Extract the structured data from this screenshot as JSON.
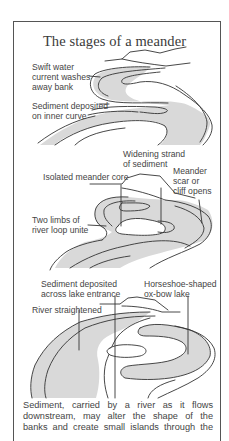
{
  "title": "The stages of a meander",
  "colors": {
    "river_fill": "#d9d9d9",
    "outline": "#333333",
    "frame": "#555555",
    "text": "#444444"
  },
  "panels": [
    {
      "stage": 1,
      "labels": [
        {
          "text": "Swift water\ncurrent washes\naway bank"
        },
        {
          "text": "Sediment deposited\non inner curve"
        }
      ]
    },
    {
      "stage": 2,
      "labels": [
        {
          "text": "Widening strand\nof sediment"
        },
        {
          "text": "Isolated meander core"
        },
        {
          "text": "Meander\nscar or\ncliff opens"
        },
        {
          "text": "Two limbs of\nriver loop unite"
        }
      ]
    },
    {
      "stage": 3,
      "labels": [
        {
          "text": "Sediment deposited\nacross lake entrance"
        },
        {
          "text": "Horseshoe-shaped\nox-bow lake"
        },
        {
          "text": "River straightened"
        }
      ]
    }
  ],
  "caption": {
    "lines": [
      "Sediment, carried by a river as it flows",
      "downstream, may alter the shape of the",
      "banks and create small islands through the"
    ]
  }
}
